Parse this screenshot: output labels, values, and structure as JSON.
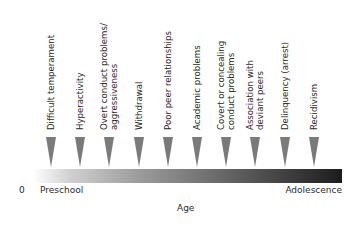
{
  "diagram": {
    "type": "timeline",
    "items": [
      {
        "lines": [
          "Difficult temperament"
        ],
        "x": 51
      },
      {
        "lines": [
          "Hyperactivity"
        ],
        "x": 80
      },
      {
        "lines": [
          "Overt conduct problems/",
          "aggressiveness"
        ],
        "x": 109
      },
      {
        "lines": [
          "Withdrawal"
        ],
        "x": 139
      },
      {
        "lines": [
          "Poor peer relationships"
        ],
        "x": 168
      },
      {
        "lines": [
          "Academic problems"
        ],
        "x": 197
      },
      {
        "lines": [
          "Covert or concealing",
          "conduct problems"
        ],
        "x": 226
      },
      {
        "lines": [
          "Association with",
          "deviant peers"
        ],
        "x": 255
      },
      {
        "lines": [
          "Delinquency (arrest)"
        ],
        "x": 285
      },
      {
        "lines": [
          "Recidivism"
        ],
        "x": 314
      }
    ],
    "axis": {
      "origin": "0",
      "start_label": "Preschool",
      "end_label": "Adolescence",
      "title": "Age"
    },
    "colors": {
      "arrow": "#7a7a7a",
      "bar_start": "#ffffff",
      "bar_end": "#1c1c1c",
      "text": "#2a2a2a"
    }
  }
}
